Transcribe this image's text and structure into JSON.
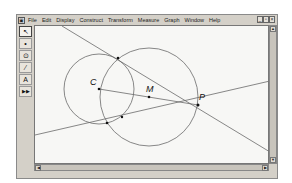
{
  "app": {
    "icon": "sketchpad-app-icon",
    "menu": [
      "File",
      "Edit",
      "Display",
      "Construct",
      "Transform",
      "Measure",
      "Graph",
      "Window",
      "Help"
    ],
    "window_controls": {
      "minimize": "_",
      "maximize": "▫",
      "close": "×"
    }
  },
  "toolbar": {
    "tools": [
      {
        "name": "arrow-tool",
        "glyph": "↖"
      },
      {
        "name": "point-tool",
        "glyph": "•"
      },
      {
        "name": "compass-tool",
        "glyph": "⊙"
      },
      {
        "name": "straightedge-tool",
        "glyph": "⁄"
      },
      {
        "name": "text-tool",
        "glyph": "A"
      },
      {
        "name": "custom-tool",
        "glyph": "▶▶"
      }
    ]
  },
  "scrollbars": {
    "up": "▲",
    "down": "▼",
    "left": "◀",
    "right": "▶"
  },
  "sketch": {
    "labels": {
      "C": "C",
      "M": "M",
      "P": "P"
    },
    "points": {
      "C": [
        97,
        87
      ],
      "M": [
        147,
        95
      ],
      "P": [
        196,
        103
      ],
      "T1": [
        116,
        56
      ],
      "T2": [
        105,
        121
      ],
      "D": [
        120,
        115
      ]
    },
    "circles": [
      {
        "name": "circle-c",
        "center": [
          97,
          87
        ],
        "r": 35
      },
      {
        "name": "circle-m",
        "center": [
          147,
          95
        ],
        "r": 49
      }
    ],
    "colors": {
      "stroke": "#6a6a6a",
      "point": "#111111"
    }
  }
}
